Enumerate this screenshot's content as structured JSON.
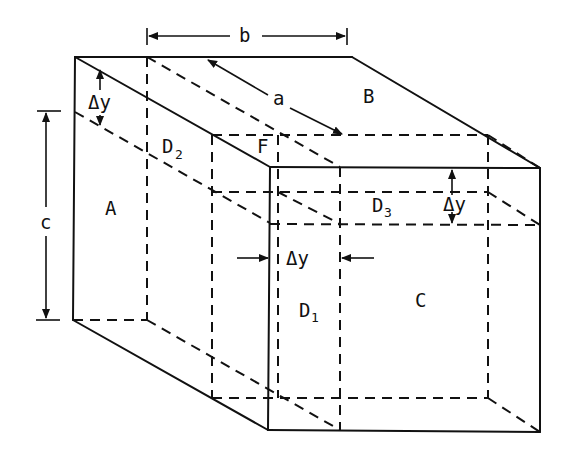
{
  "diagram": {
    "type": "isometric-box-decomposition",
    "labels": {
      "A": "A",
      "B": "B",
      "C": "C",
      "D1_base": "D",
      "D1_sub": "1",
      "D2_base": "D",
      "D2_sub": "2",
      "D3_base": "D",
      "D3_sub": "3",
      "F": "F"
    },
    "dimensions": {
      "a": "a",
      "b": "b",
      "c": "c",
      "dy_top": "Δy",
      "dy_middle": "Δy",
      "dy_right": "Δy"
    },
    "colors": {
      "line": "#111111",
      "background": "#ffffff"
    }
  }
}
